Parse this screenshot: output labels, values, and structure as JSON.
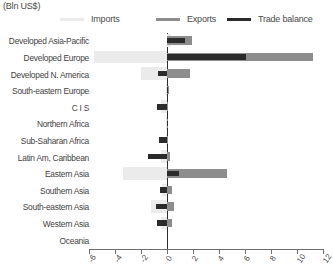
{
  "header": {
    "unit_title": "(Bln US$)"
  },
  "colors": {
    "imports": "#ebebeb",
    "exports": "#8d8d8d",
    "trade_balance": "#2b2b2b",
    "axis": "#6d6d6d",
    "zero_line": "#2e2e2e",
    "text": "#3f3f3f",
    "background": "#ffffff"
  },
  "legend": [
    {
      "key": "imports",
      "label": "Imports",
      "color": "#ebebeb",
      "left": 0
    },
    {
      "key": "exports",
      "label": "Exports",
      "color": "#8d8d8d",
      "left": 96
    },
    {
      "key": "trade_balance",
      "label": "Trade balance",
      "color": "#2b2b2b",
      "left": 167
    }
  ],
  "chart_data": {
    "type": "bar",
    "orientation": "horizontal",
    "title": "(Bln US$)",
    "xlabel": "",
    "ylabel": "",
    "xlim": [
      -6,
      12
    ],
    "xticks": [
      -6,
      -4,
      -2,
      0,
      2,
      4,
      6,
      8,
      10,
      12
    ],
    "xtick_labels": [
      "-6",
      "-4",
      "-2",
      "0",
      "2",
      "4",
      "6",
      "8",
      "10",
      "12"
    ],
    "grid": false,
    "legend_position": "top",
    "categories": [
      "Developed Asia-Pacific",
      "Developed Europe",
      "Developed N. America",
      "South-eastern Europe",
      "C I S",
      "Northern Africa",
      "Sub-Saharan Africa",
      "Latin Am, Caribbean",
      "Eastern Asia",
      "Southern Asia",
      "South-eastern Asia",
      "Western Asia",
      "Oceania"
    ],
    "series": [
      {
        "name": "Imports",
        "color": "#ebebeb",
        "values": [
          0.3,
          -5.6,
          -2.0,
          -0.1,
          -0.5,
          -0.1,
          -0.1,
          -0.5,
          -3.4,
          -0.4,
          -1.2,
          -0.5,
          0.0
        ]
      },
      {
        "name": "Exports",
        "color": "#8d8d8d",
        "values": [
          1.9,
          11.2,
          1.8,
          0.15,
          0.1,
          0.05,
          0.05,
          0.2,
          4.6,
          0.35,
          0.5,
          0.4,
          0.0
        ]
      },
      {
        "name": "Trade balance",
        "color": "#2b2b2b",
        "values": [
          1.4,
          6.1,
          -0.7,
          0.1,
          -0.75,
          0.05,
          -0.6,
          -1.5,
          0.9,
          -0.55,
          -0.85,
          -0.75,
          0.0
        ]
      }
    ]
  }
}
